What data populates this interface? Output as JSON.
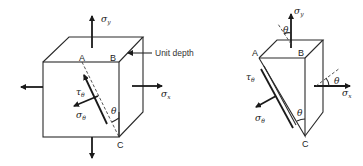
{
  "diagram": {
    "left_figure": {
      "title": "stress element cube with inclined plane",
      "points": {
        "A": "A",
        "B": "B",
        "C": "C"
      },
      "labels": {
        "sigma_y": "σ",
        "sigma_y_sub": "y",
        "sigma_x": "σ",
        "sigma_x_sub": "x",
        "tau_theta": "τ",
        "tau_theta_sub": "θ",
        "sigma_theta": "σ",
        "sigma_theta_sub": "θ",
        "theta": "θ",
        "unit_depth": "Unit depth"
      }
    },
    "right_figure": {
      "title": "wedge free body",
      "points": {
        "A": "A",
        "B": "B",
        "C": "C"
      },
      "labels": {
        "sigma_y": "σ",
        "sigma_y_sub": "y",
        "sigma_x": "σ",
        "sigma_x_sub": "x",
        "tau_theta": "τ",
        "tau_theta_sub": "θ",
        "sigma_theta": "σ",
        "sigma_theta_sub": "θ",
        "theta_top": "θ",
        "theta_right": "θ",
        "theta_bottom": "θ"
      }
    }
  }
}
